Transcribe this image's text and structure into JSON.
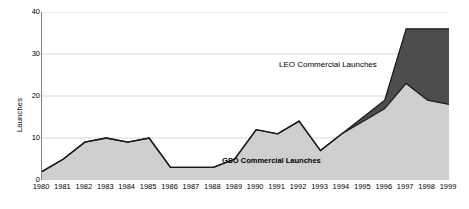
{
  "chart_data": {
    "type": "area",
    "stacked": true,
    "title": "",
    "subtitle": "",
    "xlabel": "",
    "ylabel": "Launches",
    "ylim": [
      0,
      40
    ],
    "yticks": [
      0,
      10,
      20,
      30,
      40
    ],
    "grid": true,
    "grid_axis": "y",
    "legend_position": "inline-annotation",
    "categories": [
      "1980",
      "1981",
      "1982",
      "1983",
      "1984",
      "1985",
      "1986",
      "1987",
      "1988",
      "1989",
      "1990",
      "1991",
      "1992",
      "1993",
      "1994",
      "1995",
      "1996",
      "1997",
      "1998",
      "1999"
    ],
    "x": [
      1980,
      1981,
      1982,
      1983,
      1984,
      1985,
      1986,
      1987,
      1988,
      1989,
      1990,
      1991,
      1992,
      1993,
      1994,
      1995,
      1996,
      1997,
      1998,
      1999
    ],
    "series": [
      {
        "name": "GSO Commercial Launches",
        "color": "#cfcfcf",
        "stroke": "#1a1a1a",
        "values": [
          2,
          5,
          9,
          10,
          9,
          10,
          3,
          3,
          3,
          5,
          12,
          11,
          14,
          7,
          11,
          14,
          17,
          23,
          19,
          18
        ]
      },
      {
        "name": "LEO Commercial Launches",
        "color": "#4d4d4d",
        "stroke": "#1a1a1a",
        "values": [
          0,
          0,
          0,
          0,
          0,
          0,
          0,
          0,
          0,
          0,
          0,
          0,
          0,
          0,
          0,
          1,
          2,
          13,
          17,
          18
        ]
      }
    ],
    "totals": [
      2,
      5,
      9,
      10,
      9,
      10,
      3,
      3,
      3,
      5,
      12,
      11,
      14,
      7,
      11,
      15,
      19,
      36,
      36,
      36
    ],
    "annotations": [
      {
        "text": "LEO Commercial Launches",
        "series": "LEO Commercial Launches"
      },
      {
        "text": "GSO Commercial Launches",
        "series": "GSO Commercial Launches"
      }
    ]
  },
  "axis": {
    "y_title": "Launches",
    "y_tick_labels": [
      "0",
      "10",
      "20",
      "30",
      "40"
    ],
    "x_tick_labels": [
      "1980",
      "1981",
      "1982",
      "1983",
      "1984",
      "1985",
      "1986",
      "1987",
      "1988",
      "1989",
      "1990",
      "1991",
      "1992",
      "1993",
      "1994",
      "1995",
      "1996",
      "1997",
      "1998",
      "1999"
    ]
  },
  "labels": {
    "leo": "LEO Commercial Launches",
    "gso": "GSO Commercial Launches"
  },
  "colors": {
    "gso_fill": "#cfcfcf",
    "leo_fill": "#4d4d4d",
    "line": "#1a1a1a",
    "grid": "#d9d9d9",
    "axis": "#808080",
    "background": "#ffffff"
  }
}
